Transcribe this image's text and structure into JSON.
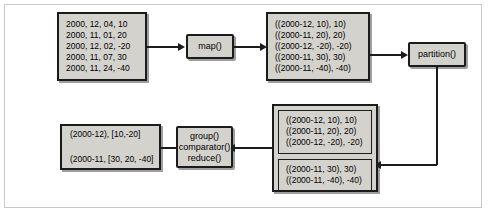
{
  "diagram": {
    "nodes": {
      "input_records": {
        "name": "input-records-box",
        "lines": [
          "2000, 12, 04, 10",
          "2000, 11, 01, 20",
          "2000, 12, 02, -20",
          "2000, 11, 07, 30",
          "2000, 11, 24, -40"
        ]
      },
      "map": {
        "name": "map-function-node",
        "label": "map()"
      },
      "mapped_pairs": {
        "name": "mapped-pairs-box",
        "lines": [
          "((2000-12, 10), 10)",
          "((2000-11, 20), 20)",
          "((2000-12, -20), -20)",
          "((2000-11, 30), 30)",
          "((2000-11, -40), -40)"
        ]
      },
      "partition": {
        "name": "partition-function-node",
        "label": "partition()"
      },
      "partitions": {
        "name": "partitioned-groups-box",
        "groups": [
          {
            "name": "partition-group-1",
            "lines": [
              "((2000-12, 10), 10)",
              "((2000-11, 20), 20)",
              "((2000-12, -20), -20)"
            ]
          },
          {
            "name": "partition-group-2",
            "lines": [
              "((2000-11, 30), 30)",
              "((2000-11, -40), -40)"
            ]
          }
        ]
      },
      "reduce": {
        "name": "group-comparator-reduce-node",
        "lines": [
          "group()",
          "comparator()",
          "reduce()"
        ]
      },
      "output": {
        "name": "output-records-box",
        "lines": [
          "(2000-12), [10,-20]",
          "(2000-11, [30, 20, -40]"
        ]
      }
    },
    "edges": [
      {
        "name": "edge-input-to-map",
        "from": "input_records",
        "to": "map"
      },
      {
        "name": "edge-map-to-mapped",
        "from": "map",
        "to": "mapped_pairs"
      },
      {
        "name": "edge-mapped-to-partition",
        "from": "mapped_pairs",
        "to": "partition"
      },
      {
        "name": "edge-partition-to-partitions",
        "from": "partition",
        "to": "partitions"
      },
      {
        "name": "edge-partitions-to-reduce",
        "from": "partitions",
        "to": "reduce"
      },
      {
        "name": "edge-reduce-to-output",
        "from": "reduce",
        "to": "output"
      }
    ],
    "colors": {
      "box_fill": "#d4d2cd",
      "box_border": "#1b1b1b",
      "frame_border": "#c9c9c9",
      "background": "#ffffff"
    }
  }
}
